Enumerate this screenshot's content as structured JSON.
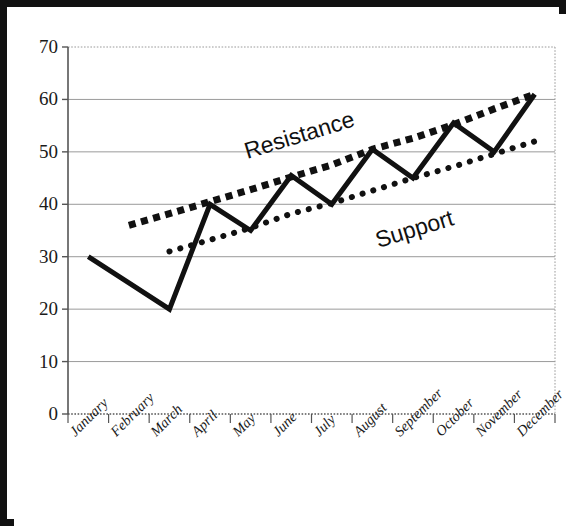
{
  "chart_data": {
    "type": "line",
    "title": "",
    "subtitle": "",
    "xlabel": "",
    "ylabel": "",
    "ylim": [
      0,
      70
    ],
    "ytick_step": 10,
    "yticks": [
      0,
      10,
      20,
      30,
      40,
      50,
      60,
      70
    ],
    "grid": true,
    "grid_axis": "y",
    "legend": false,
    "categories": [
      "January",
      "February",
      "March",
      "April",
      "May",
      "June",
      "July",
      "August",
      "September",
      "October",
      "November",
      "December"
    ],
    "series": [
      {
        "name": "Price",
        "style": "solid",
        "color": "#111111",
        "width": 5,
        "values": [
          30,
          25,
          20,
          40,
          35,
          45.5,
          40,
          50.5,
          45,
          55.5,
          50,
          61
        ]
      },
      {
        "name": "Resistance",
        "style": "square-dashed",
        "color": "#111111",
        "width": 7,
        "x_start": "February",
        "x_end": "December",
        "values": [
          null,
          36,
          38.2,
          40.5,
          42.8,
          45.2,
          47.5,
          50.5,
          52.6,
          55.2,
          58.2,
          61
        ]
      },
      {
        "name": "Support",
        "style": "round-dotted",
        "color": "#111111",
        "width": 6,
        "x_start": "March",
        "x_end": "December",
        "values": [
          null,
          null,
          31,
          33.2,
          35.5,
          38.2,
          40.2,
          42.6,
          45,
          47.2,
          49.6,
          52
        ]
      }
    ],
    "annotations": [
      {
        "text": "Resistance",
        "x_frac": 0.355,
        "y_value": 52.5,
        "rotation": -17
      },
      {
        "text": "Support",
        "x_frac": 0.625,
        "y_value": 35.5,
        "rotation": -17
      }
    ]
  },
  "axes": {
    "y_tick_labels": [
      "70",
      "60",
      "50",
      "40",
      "30",
      "20",
      "10",
      "0"
    ],
    "x_tick_labels": [
      "January",
      "February",
      "March",
      "April",
      "May",
      "June",
      "July",
      "August",
      "September",
      "October",
      "November",
      "December"
    ]
  },
  "colors": {
    "ink": "#111111",
    "grid": "#9a9a9a",
    "axis": "#555555",
    "background": "#ffffff",
    "border": "#111111"
  }
}
